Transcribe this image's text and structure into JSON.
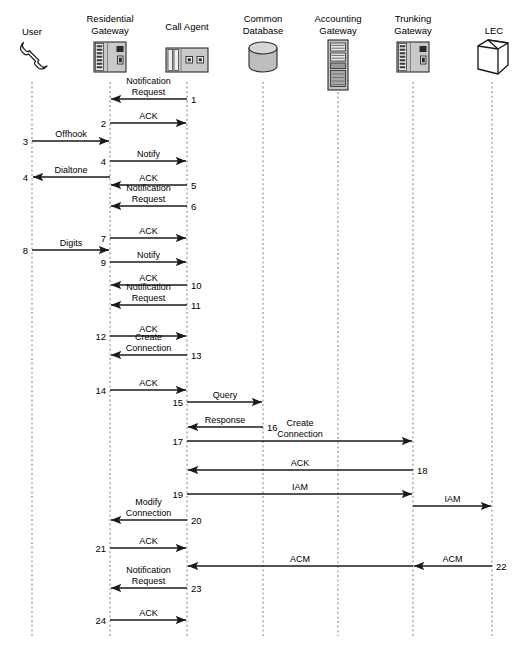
{
  "diagram": {
    "type": "sequence-diagram",
    "width": 526,
    "height": 646,
    "colors": {
      "background": "#ffffff",
      "line": "#1a1a1a",
      "lifeline": "#8a8a8a",
      "icon_fill_light": "#d9d9d9",
      "icon_fill_mid": "#b5b5b5",
      "icon_fill_dark": "#4a4a4a"
    }
  },
  "actors": [
    {
      "id": "user",
      "label": "User",
      "label_lines": [
        "User"
      ],
      "icon": "telephone-handset-icon",
      "x": 32,
      "icon_y": 60
    },
    {
      "id": "residential-gateway",
      "label": "Residential Gateway",
      "label_lines": [
        "Residential",
        "Gateway"
      ],
      "icon": "gateway-device-icon",
      "x": 110,
      "icon_y": 60
    },
    {
      "id": "call-agent",
      "label": "Call Agent",
      "label_lines": [
        "Call Agent"
      ],
      "icon": "call-agent-device-icon",
      "x": 187,
      "icon_y": 60
    },
    {
      "id": "common-database",
      "label": "Common Database",
      "label_lines": [
        "Common",
        "Database"
      ],
      "icon": "database-cylinder-icon",
      "x": 263,
      "icon_y": 60
    },
    {
      "id": "accounting-gateway",
      "label": "Accounting Gateway",
      "label_lines": [
        "Accounting",
        "Gateway"
      ],
      "icon": "server-rack-icon",
      "x": 338,
      "icon_y": 60
    },
    {
      "id": "trunking-gateway",
      "label": "Trunking Gateway",
      "label_lines": [
        "Trunking",
        "Gateway"
      ],
      "icon": "gateway-device-icon",
      "x": 413,
      "icon_y": 60
    },
    {
      "id": "lec",
      "label": "LEC",
      "label_lines": [
        "LEC"
      ],
      "icon": "network-cloud-box-icon",
      "x": 492,
      "icon_y": 60
    }
  ],
  "messages": [
    {
      "num": "1",
      "label_lines": [
        "Notification",
        "Request"
      ],
      "from": "call-agent",
      "to": "residential-gateway",
      "y": 99,
      "num_side": "right"
    },
    {
      "num": "2",
      "label_lines": [
        "ACK"
      ],
      "from": "residential-gateway",
      "to": "call-agent",
      "y": 123,
      "num_side": "left"
    },
    {
      "num": "3",
      "label_lines": [
        "Offhook"
      ],
      "from": "user",
      "to": "residential-gateway",
      "y": 141,
      "num_side": "left"
    },
    {
      "num": "4",
      "label_lines": [
        "Notify"
      ],
      "from": "residential-gateway",
      "to": "call-agent",
      "y": 161,
      "num_side": "left"
    },
    {
      "num": "4",
      "label_lines": [
        "Dialtone"
      ],
      "from": "residential-gateway",
      "to": "user",
      "y": 177,
      "num_side": "left"
    },
    {
      "num": "5",
      "label_lines": [
        "ACK"
      ],
      "from": "call-agent",
      "to": "residential-gateway",
      "y": 185,
      "num_side": "right"
    },
    {
      "num": "6",
      "label_lines": [
        "Notification",
        "Request"
      ],
      "from": "call-agent",
      "to": "residential-gateway",
      "y": 206,
      "num_side": "right"
    },
    {
      "num": "7",
      "label_lines": [
        "ACK"
      ],
      "from": "residential-gateway",
      "to": "call-agent",
      "y": 238,
      "num_side": "left"
    },
    {
      "num": "8",
      "label_lines": [
        "Digits"
      ],
      "from": "user",
      "to": "residential-gateway",
      "y": 250,
      "num_side": "left"
    },
    {
      "num": "9",
      "label_lines": [
        "Notify"
      ],
      "from": "residential-gateway",
      "to": "call-agent",
      "y": 262,
      "num_side": "left"
    },
    {
      "num": "10",
      "label_lines": [
        "ACK"
      ],
      "from": "call-agent",
      "to": "residential-gateway",
      "y": 285,
      "num_side": "right"
    },
    {
      "num": "11",
      "label_lines": [
        "Notification",
        "Request"
      ],
      "from": "call-agent",
      "to": "residential-gateway",
      "y": 305,
      "num_side": "right"
    },
    {
      "num": "12",
      "label_lines": [
        "ACK"
      ],
      "from": "residential-gateway",
      "to": "call-agent",
      "y": 336,
      "num_side": "left"
    },
    {
      "num": "13",
      "label_lines": [
        "Create",
        "Connection"
      ],
      "from": "call-agent",
      "to": "residential-gateway",
      "y": 355,
      "num_side": "right"
    },
    {
      "num": "14",
      "label_lines": [
        "ACK"
      ],
      "from": "residential-gateway",
      "to": "call-agent",
      "y": 390,
      "num_side": "left"
    },
    {
      "num": "15",
      "label_lines": [
        "Query"
      ],
      "from": "call-agent",
      "to": "common-database",
      "y": 402,
      "num_side": "left"
    },
    {
      "num": "16",
      "label_lines": [
        "Response"
      ],
      "from": "common-database",
      "to": "call-agent",
      "y": 427,
      "num_side": "right"
    },
    {
      "num": "17",
      "label_lines": [
        "Create",
        "Connection"
      ],
      "from": "call-agent",
      "to": "trunking-gateway",
      "y": 441,
      "num_side": "left"
    },
    {
      "num": "18",
      "label_lines": [
        "ACK"
      ],
      "from": "trunking-gateway",
      "to": "call-agent",
      "y": 470,
      "num_side": "right"
    },
    {
      "num": "19",
      "label_lines": [
        "IAM"
      ],
      "from": "call-agent",
      "to": "trunking-gateway",
      "y": 494,
      "num_side": "left"
    },
    {
      "num": "",
      "label_lines": [
        "IAM"
      ],
      "from": "trunking-gateway",
      "to": "lec",
      "y": 506,
      "num_side": "none"
    },
    {
      "num": "20",
      "label_lines": [
        "Modify",
        "Connection"
      ],
      "from": "call-agent",
      "to": "residential-gateway",
      "y": 520,
      "num_side": "right"
    },
    {
      "num": "21",
      "label_lines": [
        "ACK"
      ],
      "from": "residential-gateway",
      "to": "call-agent",
      "y": 548,
      "num_side": "left"
    },
    {
      "num": "22",
      "label_lines": [
        "ACM"
      ],
      "from": "lec",
      "to": "trunking-gateway",
      "y": 566,
      "num_side": "right"
    },
    {
      "num": "",
      "label_lines": [
        "ACM"
      ],
      "from": "trunking-gateway",
      "to": "call-agent",
      "y": 566,
      "num_side": "none"
    },
    {
      "num": "23",
      "label_lines": [
        "Notification",
        "Request"
      ],
      "from": "call-agent",
      "to": "residential-gateway",
      "y": 588,
      "num_side": "right"
    },
    {
      "num": "24",
      "label_lines": [
        "ACK"
      ],
      "from": "residential-gateway",
      "to": "call-agent",
      "y": 620,
      "num_side": "left"
    }
  ]
}
